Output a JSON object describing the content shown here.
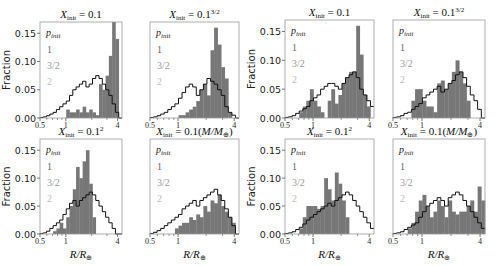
{
  "figure": {
    "legend_title": "p_init",
    "legend_entries": [
      "1",
      "3/2",
      "2"
    ],
    "legend_colors": [
      "#666666",
      "#999999",
      "#bbbbbb"
    ],
    "bar_color": "#777777",
    "line_color": "#111111"
  },
  "chart_data": [
    {
      "type": "bar",
      "panel": "left-top-left",
      "title": "X_init = 0.1",
      "ylabel": "Fraction",
      "xlabel": "",
      "xscale": "log",
      "xlim": [
        0.5,
        4.5
      ],
      "ylim": [
        0,
        0.17
      ],
      "yticks": [
        0.0,
        0.05,
        0.1,
        0.15
      ],
      "xticks": [
        "0.5",
        "1",
        "4"
      ],
      "bins_log_range": [
        0.5,
        4.5
      ],
      "bars": [
        0,
        0,
        0,
        0,
        0,
        0,
        0,
        0,
        0.015,
        0.01,
        0.01,
        0.015,
        0.01,
        0.02,
        0.01,
        0.015,
        0.01,
        0.005,
        0.06,
        0.05,
        0.075,
        0.11,
        0.17,
        0.14,
        0.0
      ],
      "step": [
        0.001,
        0.002,
        0.004,
        0.007,
        0.01,
        0.015,
        0.02,
        0.025,
        0.03,
        0.04,
        0.05,
        0.055,
        0.06,
        0.065,
        0.055,
        0.06,
        0.07,
        0.075,
        0.07,
        0.06,
        0.05,
        0.04,
        0.025,
        0.01,
        0.0
      ]
    },
    {
      "type": "bar",
      "panel": "left-top-right",
      "title": "X_init = 0.1^{3/2}",
      "xscale": "log",
      "xlim": [
        0.5,
        4.5
      ],
      "ylim": [
        0,
        0.17
      ],
      "xticks": [
        "0.5",
        "1",
        "4"
      ],
      "bars": [
        0,
        0,
        0,
        0,
        0,
        0,
        0,
        0,
        0.005,
        0.005,
        0.01,
        0.015,
        0.02,
        0.03,
        0.05,
        0.06,
        0.04,
        0.12,
        0.16,
        0.13,
        0.09,
        0.07,
        0.01,
        0,
        0
      ],
      "step": [
        0.001,
        0.002,
        0.004,
        0.007,
        0.01,
        0.015,
        0.02,
        0.025,
        0.035,
        0.045,
        0.055,
        0.06,
        0.055,
        0.04,
        0.05,
        0.06,
        0.07,
        0.065,
        0.06,
        0.05,
        0.04,
        0.02,
        0.01,
        0.005,
        0.0
      ]
    },
    {
      "type": "bar",
      "panel": "left-bottom-left",
      "title": "X_init = 0.1^2",
      "ylabel": "Fraction",
      "xlabel": "R/R_⊕",
      "xscale": "log",
      "xlim": [
        0.5,
        4.5
      ],
      "ylim": [
        0,
        0.17
      ],
      "yticks": [
        0.0,
        0.05,
        0.1,
        0.15
      ],
      "xticks": [
        "0.5",
        "1",
        "4"
      ],
      "bars": [
        0,
        0,
        0,
        0,
        0.005,
        0.01,
        0.02,
        0.01,
        0.03,
        0.05,
        0.08,
        0.12,
        0.1,
        0.13,
        0.15,
        0.09,
        0.03,
        0,
        0,
        0,
        0,
        0,
        0,
        0,
        0
      ],
      "step": [
        0.001,
        0.002,
        0.005,
        0.01,
        0.015,
        0.02,
        0.025,
        0.035,
        0.045,
        0.055,
        0.06,
        0.05,
        0.06,
        0.065,
        0.07,
        0.075,
        0.07,
        0.06,
        0.05,
        0.04,
        0.03,
        0.02,
        0.01,
        0.0,
        0.0
      ]
    },
    {
      "type": "bar",
      "panel": "left-bottom-right",
      "title": "X_init = 0.1(M/M_⊕)",
      "xlabel": "R/R_⊕",
      "xscale": "log",
      "xlim": [
        0.5,
        4.5
      ],
      "ylim": [
        0,
        0.17
      ],
      "xticks": [
        "0.5",
        "1",
        "4"
      ],
      "bars": [
        0,
        0,
        0,
        0,
        0,
        0,
        0,
        0.01,
        0.015,
        0.02,
        0.02,
        0.03,
        0.025,
        0.035,
        0.03,
        0.05,
        0.04,
        0.06,
        0.055,
        0.07,
        0.05,
        0.04,
        0.03,
        0.02,
        0.0
      ],
      "step": [
        0.001,
        0.003,
        0.006,
        0.01,
        0.015,
        0.02,
        0.025,
        0.03,
        0.035,
        0.045,
        0.05,
        0.055,
        0.06,
        0.05,
        0.06,
        0.065,
        0.07,
        0.075,
        0.08,
        0.07,
        0.06,
        0.045,
        0.03,
        0.015,
        0.0
      ]
    },
    {
      "type": "bar",
      "panel": "right-top-left",
      "title": "X_init = 0.1",
      "ylabel": "Fraction",
      "xscale": "log",
      "xlim": [
        0.5,
        4.5
      ],
      "ylim": [
        0,
        0.17
      ],
      "yticks": [
        0.0,
        0.05,
        0.1,
        0.15
      ],
      "xticks": [
        "0.5",
        "1",
        "4"
      ],
      "bars": [
        0,
        0,
        0,
        0,
        0.01,
        0.02,
        0.03,
        0.05,
        0.03,
        0.02,
        0.01,
        0.0,
        0.03,
        0.05,
        0.025,
        0.04,
        0.06,
        0.07,
        0.08,
        0.08,
        0.16,
        0.11,
        0.04,
        0.02,
        0.0
      ],
      "step": [
        0.001,
        0.002,
        0.004,
        0.008,
        0.012,
        0.016,
        0.02,
        0.03,
        0.035,
        0.04,
        0.05,
        0.055,
        0.06,
        0.06,
        0.055,
        0.05,
        0.06,
        0.07,
        0.075,
        0.08,
        0.07,
        0.05,
        0.04,
        0.03,
        0.02
      ]
    },
    {
      "type": "bar",
      "panel": "right-top-right",
      "title": "X_init = 0.1^{3/2}",
      "xscale": "log",
      "xlim": [
        0.5,
        4.5
      ],
      "ylim": [
        0,
        0.17
      ],
      "xticks": [
        "0.5",
        "1",
        "4"
      ],
      "bars": [
        0,
        0,
        0,
        0,
        0,
        0.03,
        0.05,
        0.05,
        0.03,
        0.02,
        0.02,
        0.01,
        0.06,
        0.065,
        0.05,
        0.06,
        0.08,
        0.1,
        0.08,
        0.06,
        0.03,
        0.0,
        0,
        0,
        0
      ],
      "step": [
        0.001,
        0.002,
        0.004,
        0.008,
        0.01,
        0.015,
        0.02,
        0.025,
        0.035,
        0.04,
        0.045,
        0.05,
        0.055,
        0.045,
        0.05,
        0.06,
        0.065,
        0.075,
        0.08,
        0.07,
        0.055,
        0.04,
        0.03,
        0.015,
        0.0
      ]
    },
    {
      "type": "bar",
      "panel": "right-bottom-left",
      "title": "X_init = 0.1^2",
      "ylabel": "Fraction",
      "xlabel": "R/R_⊕",
      "xscale": "log",
      "xlim": [
        0.5,
        4.5
      ],
      "ylim": [
        0,
        0.17
      ],
      "yticks": [
        0.0,
        0.05,
        0.1,
        0.15
      ],
      "xticks": [
        "0.5",
        "1",
        "4"
      ],
      "bars": [
        0,
        0,
        0,
        0,
        0.01,
        0.03,
        0.05,
        0.05,
        0.05,
        0.045,
        0.05,
        0.1,
        0.08,
        0.06,
        0.11,
        0.09,
        0.06,
        0.03,
        0,
        0,
        0,
        0,
        0,
        0,
        0
      ],
      "step": [
        0.001,
        0.002,
        0.004,
        0.008,
        0.012,
        0.018,
        0.025,
        0.03,
        0.035,
        0.04,
        0.045,
        0.05,
        0.055,
        0.05,
        0.06,
        0.065,
        0.07,
        0.075,
        0.07,
        0.06,
        0.05,
        0.04,
        0.03,
        0.02,
        0.01
      ]
    },
    {
      "type": "bar",
      "panel": "right-bottom-right",
      "title": "X_init = 0.1(M/M_⊕)",
      "xlabel": "R/R_⊕",
      "xscale": "log",
      "xlim": [
        0.5,
        4.5
      ],
      "ylim": [
        0,
        0.17
      ],
      "xticks": [
        "0.5",
        "1",
        "4"
      ],
      "bars": [
        0,
        0,
        0,
        0,
        0.01,
        0.02,
        0.04,
        0.06,
        0.07,
        0.05,
        0.03,
        0.04,
        0.06,
        0.05,
        0.03,
        0.06,
        0.04,
        0.035,
        0.04,
        0.04,
        0.05,
        0.06,
        0.04,
        0.085,
        0.06
      ],
      "step": [
        0.001,
        0.002,
        0.004,
        0.008,
        0.012,
        0.016,
        0.02,
        0.03,
        0.04,
        0.05,
        0.055,
        0.06,
        0.065,
        0.06,
        0.05,
        0.065,
        0.07,
        0.075,
        0.07,
        0.06,
        0.05,
        0.04,
        0.03,
        0.02,
        0.01
      ]
    }
  ]
}
